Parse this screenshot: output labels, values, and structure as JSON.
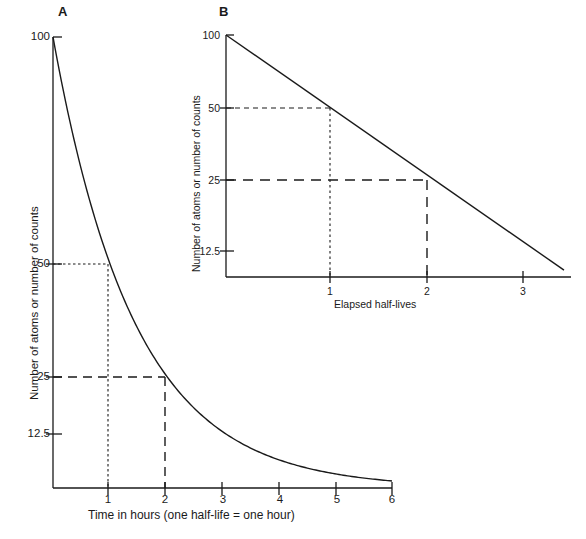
{
  "figure": {
    "panels": [
      {
        "letter": "A",
        "ylabel": "Number of atoms or number of counts",
        "xlabel": "Time in hours (one half-life = one hour)",
        "yticks": [
          "100",
          "50",
          "25",
          "12.5"
        ],
        "xticks": [
          "1",
          "2",
          "3",
          "4",
          "5",
          "6"
        ]
      },
      {
        "letter": "B",
        "ylabel": "Number of atoms or number of counts",
        "xlabel": "Elapsed half-lives",
        "yticks": [
          "100",
          "50",
          "25",
          "12.5"
        ],
        "xticks": [
          "1",
          "2",
          "3"
        ]
      }
    ]
  },
  "chart_data": [
    {
      "type": "line",
      "panel": "A",
      "title": "A",
      "xlabel": "Time in hours (one half-life = one hour)",
      "ylabel": "Number of atoms or number of counts",
      "yscale": "linear",
      "xlim": [
        0,
        6
      ],
      "ylim": [
        0,
        100
      ],
      "yticks": [
        100,
        50,
        25,
        12.5
      ],
      "xticks": [
        1,
        2,
        3,
        4,
        5,
        6
      ],
      "grid": false,
      "legend": null,
      "series": [
        {
          "name": "Radioactive decay (half-life = 1 hour)",
          "x": [
            0,
            0.25,
            0.5,
            0.75,
            1,
            1.25,
            1.5,
            1.75,
            2,
            2.5,
            3,
            3.5,
            4,
            4.5,
            5,
            5.5,
            6
          ],
          "values": [
            100,
            84.1,
            70.7,
            59.5,
            50,
            42.0,
            35.4,
            29.7,
            25,
            17.7,
            12.5,
            8.8,
            6.25,
            4.4,
            3.125,
            2.2,
            1.5625
          ]
        }
      ],
      "annotations": [
        {
          "type": "guide-dotted",
          "y": 50,
          "x": 1,
          "label": "50 at 1 hour"
        },
        {
          "type": "guide-dashed",
          "y": 25,
          "x": 2,
          "label": "25 at 2 hours"
        }
      ]
    },
    {
      "type": "line",
      "panel": "B",
      "title": "B",
      "xlabel": "Elapsed half-lives",
      "ylabel": "Number of atoms or number of counts",
      "yscale": "log2",
      "xlim": [
        0,
        3.4
      ],
      "ylim": [
        9,
        100
      ],
      "yticks": [
        100,
        50,
        25,
        12.5
      ],
      "xticks": [
        1,
        2,
        3
      ],
      "grid": false,
      "legend": null,
      "series": [
        {
          "name": "Radioactive decay, semilogarithmic",
          "x": [
            0,
            1,
            2,
            3,
            3.25
          ],
          "values": [
            100,
            50,
            25,
            12.5,
            10.5
          ]
        }
      ],
      "annotations": [
        {
          "type": "guide-dotted",
          "y": 50,
          "x": 1,
          "label": "50 at 1 half-life"
        },
        {
          "type": "guide-dashed",
          "y": 25,
          "x": 2,
          "label": "25 at 2 half-lives"
        }
      ]
    }
  ]
}
